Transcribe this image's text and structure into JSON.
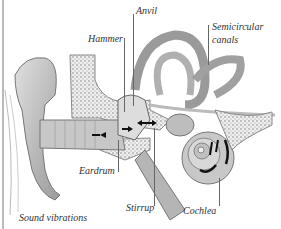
{
  "diagram": {
    "labels": {
      "anvil": "Anvil",
      "hammer": "Hammer",
      "semicircular": "Semicircular",
      "canals": "canals",
      "eardrum": "Eardrum",
      "stirrup": "Stirrup",
      "cochlea": "Cochlea",
      "sound": "Sound vibrations"
    },
    "colors": {
      "background": "#ffffff",
      "tissue": "#bdbdbd",
      "dark": "#555555",
      "bone": "#e6e6e6"
    }
  }
}
